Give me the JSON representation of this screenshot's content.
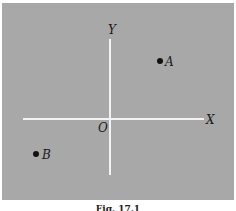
{
  "figure": {
    "axes": {
      "x_label": "X",
      "y_label": "Y",
      "origin_label": "O"
    },
    "points": [
      {
        "label": "A",
        "quadrant": "I"
      },
      {
        "label": "B",
        "quadrant": "III"
      }
    ],
    "caption": "Fig. 17.1"
  },
  "colors": {
    "background": "#a8a8a8",
    "axis": "#f2f2f2",
    "text": "#1a1a1a"
  }
}
